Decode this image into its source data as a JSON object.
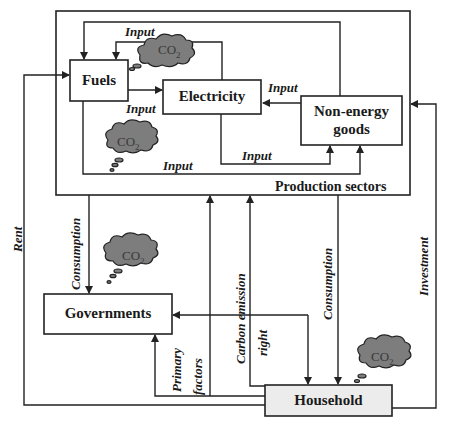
{
  "diagram": {
    "container": {
      "label": "Production sectors"
    },
    "nodes": {
      "fuels": {
        "label": "Fuels"
      },
      "electricity": {
        "label": "Electricity"
      },
      "non_energy_line1": "Non-energy",
      "non_energy_line2": "goods",
      "governments": {
        "label": "Governments"
      },
      "household": {
        "label": "Household"
      }
    },
    "flows": {
      "input_top": "Input",
      "input_fuels_elec": "Input",
      "input_neg_elec": "Input",
      "input_elec_neg": "Input",
      "input_fuels_neg": "Input",
      "rent": "Rent",
      "consumption_gov": "Consumption",
      "primary_line1": "Primary",
      "primary_line2": "factors",
      "carbon_line1": "Carbon emission",
      "carbon_line2": "right",
      "consumption_house": "Consumption",
      "investment": "Investment"
    },
    "emissions": {
      "co2_text": "CO",
      "co2_sub": "2"
    },
    "colors": {
      "line": "#222222",
      "cloud": "#7d7d7d",
      "household_fill": "#ececec"
    }
  }
}
